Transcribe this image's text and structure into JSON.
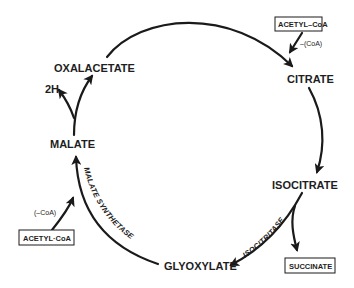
{
  "diagram": {
    "type": "metabolic-cycle",
    "nodes": {
      "oxalacetate": "OXALACETATE",
      "citrate": "CITRATE",
      "isocitrate": "ISOCITRATE",
      "glyoxylate": "GLYOXYLATE",
      "malate": "MALATE",
      "succinate": "SUCCINATE",
      "acetyl_coa_top": "ACETYL–CoA",
      "acetyl_coa_bottom": "ACETYL·CoA",
      "two_h": "2H"
    },
    "annotations": {
      "coa_released_top": "–(CoA)",
      "coa_released_bottom": "(–CoA)"
    },
    "enzymes": {
      "isocitritase": "ISOCITRITASE",
      "malate_synthetase": "MALATE SYNTHETASE"
    },
    "edges": [
      {
        "from": "OXALACETATE",
        "to": "CITRATE"
      },
      {
        "from": "ACETYL–CoA",
        "to": "CITRATE"
      },
      {
        "from": "CITRATE",
        "to": "ISOCITRATE"
      },
      {
        "from": "ISOCITRATE",
        "to": "GLYOXYLATE",
        "label": "ISOCITRITASE"
      },
      {
        "from": "ISOCITRATE",
        "to": "SUCCINATE"
      },
      {
        "from": "GLYOXYLATE",
        "to": "MALATE",
        "label": "MALATE SYNTHETASE"
      },
      {
        "from": "ACETYL·CoA",
        "to": "MALATE"
      },
      {
        "from": "MALATE",
        "to": "OXALACETATE"
      },
      {
        "from": "MALATE",
        "to": "2H"
      }
    ],
    "colors": {
      "ink": "#1a1a1a",
      "background": "#ffffff"
    }
  }
}
